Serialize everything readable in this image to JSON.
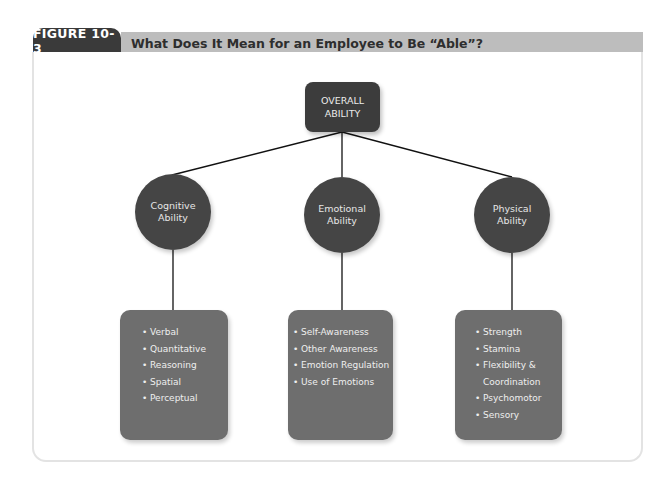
{
  "header": {
    "figure_label": "FIGURE 10-3",
    "title": "What Does It Mean for an Employee to Be “Able”?"
  },
  "diagram": {
    "root": {
      "line1": "OVERALL",
      "line2": "ABILITY"
    },
    "branches": [
      {
        "line1": "Cognitive",
        "line2": "Ability",
        "items": [
          "Verbal",
          "Quantitative",
          "Reasoning",
          "Spatial",
          "Perceptual"
        ]
      },
      {
        "line1": "Emotional",
        "line2": "Ability",
        "items": [
          "Self-Awareness",
          "Other Awareness",
          "Emotion Regulation",
          "Use of Emotions"
        ]
      },
      {
        "line1": "Physical",
        "line2": "Ability",
        "items": [
          "Strength",
          "Stamina",
          "Flexibility &",
          "Coordination",
          "Psychomotor",
          "Sensory"
        ]
      }
    ]
  },
  "colors": {
    "tab": "#3a3a3a",
    "title_bar": "#bdbdbd",
    "root_node": "#3c3c3c",
    "circle_node": "#454545",
    "list_box": "#6e6e6e"
  }
}
